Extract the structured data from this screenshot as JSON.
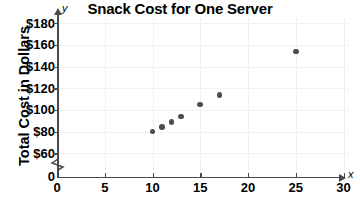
{
  "chart_data": {
    "type": "scatter",
    "title": "Snack Cost for One Server",
    "xlabel": "",
    "ylabel": "Total Cost in Dollars",
    "x_axis_letter": "x",
    "y_axis_letter": "y",
    "xlim": [
      0,
      30
    ],
    "ylim": [
      60,
      180
    ],
    "y_axis_break": true,
    "y_axis_break_from": 0,
    "y_axis_break_to": 60,
    "grid": true,
    "legend": "none",
    "x_ticks": [
      0,
      5,
      10,
      15,
      20,
      25,
      30
    ],
    "x_tick_labels": [
      "0",
      "5",
      "10",
      "15",
      "20",
      "25",
      "30"
    ],
    "y_ticks": [
      0,
      60,
      80,
      100,
      120,
      140,
      160,
      180
    ],
    "y_tick_labels": [
      "0",
      "$60",
      "$80",
      "$100",
      "$120",
      "$140",
      "$160",
      "$180"
    ],
    "point_color": "#4d4d4d",
    "axis_color": "#4a4a4a",
    "grid_color": "#f0f0f0",
    "points": [
      {
        "x": 10,
        "y": 80
      },
      {
        "x": 11,
        "y": 84
      },
      {
        "x": 12,
        "y": 89
      },
      {
        "x": 13,
        "y": 94
      },
      {
        "x": 15,
        "y": 105
      },
      {
        "x": 17,
        "y": 114
      },
      {
        "x": 25,
        "y": 154
      }
    ]
  }
}
